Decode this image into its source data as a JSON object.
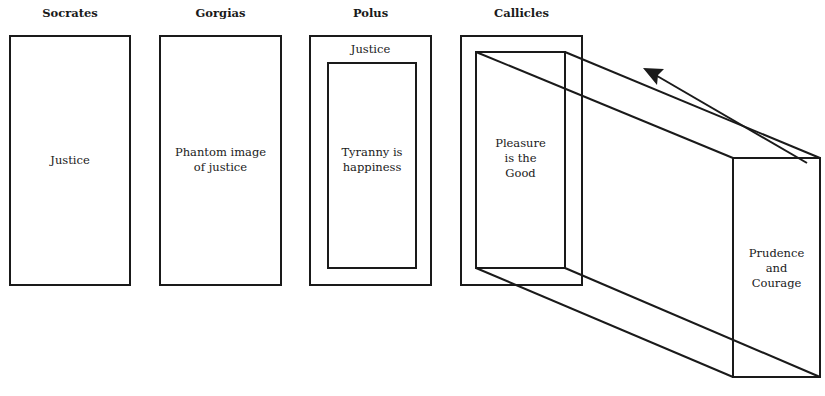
{
  "headers": [
    "Socrates",
    "Gorgias",
    "Polus",
    "Callicles"
  ],
  "boxes": {
    "socrates": "Justice",
    "gorgias": "Phantom image\nof justice",
    "polus_outer": "Justice",
    "polus_inner": "Tyranny is\nhappiness",
    "callicles_front": "Pleasure\nis the\nGood",
    "callicles_back": "Prudence\nand\nCourage"
  },
  "arrow": {
    "direction": "back-left",
    "meaning": "projection toward Callicles' front face"
  },
  "colors": {
    "line": "#1a1a1a",
    "background": "#ffffff"
  }
}
